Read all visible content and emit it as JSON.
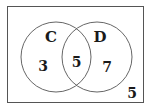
{
  "diagram": {
    "type": "venn",
    "universe": {
      "outside_value": "5"
    },
    "sets": [
      {
        "name": "C",
        "only_value": "3"
      },
      {
        "name": "D",
        "only_value": "7"
      }
    ],
    "intersection_value": "5",
    "colors": {
      "stroke": "#555555",
      "text": "#1a1a1a",
      "background": "#ffffff"
    }
  }
}
